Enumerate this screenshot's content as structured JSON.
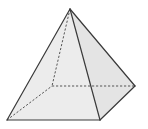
{
  "diagram": {
    "type": "3d-solid-wireframe",
    "vertices": {
      "apex": [
        70,
        9
      ],
      "front_left": [
        7,
        120
      ],
      "front_right": [
        100,
        120
      ],
      "back_right": [
        135,
        86
      ],
      "back_left_hidden": [
        52,
        86
      ]
    },
    "visible_edges": [
      [
        "apex",
        "front_left"
      ],
      [
        "apex",
        "front_right"
      ],
      [
        "apex",
        "back_right"
      ],
      [
        "front_left",
        "front_right"
      ],
      [
        "front_right",
        "back_right"
      ]
    ],
    "hidden_edges": [
      [
        "apex",
        "back_left_hidden"
      ],
      [
        "front_left",
        "back_left_hidden"
      ],
      [
        "back_left_hidden",
        "back_right"
      ]
    ],
    "colors": {
      "front_face": "#ececec",
      "side_face": "#e4e4e4",
      "edge": "#3a3a3a",
      "hidden_edge": "#555555",
      "background": "#ffffff"
    }
  }
}
